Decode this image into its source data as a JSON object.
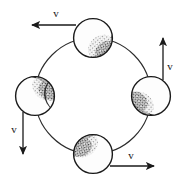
{
  "figure": {
    "kind": "physics-diagram",
    "background_color": "#ffffff",
    "ink_color": "#1a1a1a",
    "orbit": {
      "center_x": 93,
      "center_y": 96,
      "radius": 58,
      "stroke_width": 1.1
    },
    "balls": [
      {
        "id": "ball-top",
        "position_label": "top",
        "cx": 93,
        "cy": 38,
        "r": 20,
        "shade_side": "lower-right",
        "fill": "#fdfdfd",
        "shade_color": "#2b2b2b"
      },
      {
        "id": "ball-right",
        "position_label": "right",
        "cx": 151,
        "cy": 96,
        "r": 20,
        "shade_side": "lower-left",
        "fill": "#fdfdfd",
        "shade_color": "#2b2b2b"
      },
      {
        "id": "ball-bottom",
        "position_label": "bottom",
        "cx": 93,
        "cy": 154,
        "r": 20,
        "shade_side": "upper-left",
        "fill": "#fdfdfd",
        "shade_color": "#2b2b2b"
      },
      {
        "id": "ball-left",
        "position_label": "left",
        "cx": 35,
        "cy": 96,
        "r": 20,
        "shade_side": "upper-right",
        "fill": "#fdfdfd",
        "shade_color": "#2b2b2b"
      }
    ],
    "vectors": [
      {
        "id": "vector-top",
        "label": "v",
        "direction": "left",
        "from_x": 76,
        "from_y": 25,
        "to_x": 30,
        "to_y": 25,
        "label_x": 56,
        "label_y": 15
      },
      {
        "id": "vector-right",
        "label": "v",
        "direction": "up",
        "from_x": 163,
        "from_y": 80,
        "to_x": 163,
        "to_y": 36,
        "label_x": 170,
        "label_y": 67
      },
      {
        "id": "vector-bottom",
        "label": "v",
        "direction": "right",
        "from_x": 110,
        "from_y": 166,
        "to_x": 156,
        "to_y": 166,
        "label_x": 130,
        "label_y": 158
      },
      {
        "id": "vector-left",
        "label": "v",
        "direction": "down",
        "from_x": 23,
        "from_y": 112,
        "to_x": 23,
        "to_y": 156,
        "label_x": 13,
        "label_y": 130
      }
    ]
  }
}
